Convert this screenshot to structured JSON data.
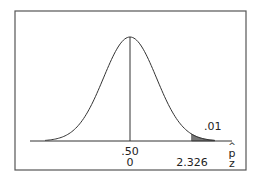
{
  "chart_data": {
    "type": "area",
    "title": "",
    "distribution": "normal",
    "mean": 0,
    "sd": 1,
    "xlim": [
      -3.2,
      3.2
    ],
    "axes": [
      {
        "name": "p-hat",
        "label": "p̂",
        "ticks": [
          {
            "x": 0,
            "label": ".50"
          }
        ]
      },
      {
        "name": "z",
        "label": "z",
        "ticks": [
          {
            "x": 0,
            "label": "0"
          },
          {
            "x": 2.326,
            "label": "2.326"
          }
        ]
      }
    ],
    "shaded_region": {
      "from": 2.326,
      "to": 3.2,
      "area": 0.01,
      "label": ".01"
    },
    "vertical_line_at": 0,
    "grid": false,
    "legend": null
  },
  "labels": {
    "tail_area": ".01",
    "phat_center": ".50",
    "z_center": "0",
    "z_critical": "2.326",
    "phat_axis": "p",
    "phat_hat": "^",
    "z_axis": "z"
  },
  "colors": {
    "frame": "#555555",
    "curve": "#333333",
    "shade": "#777777",
    "text": "#222222"
  }
}
